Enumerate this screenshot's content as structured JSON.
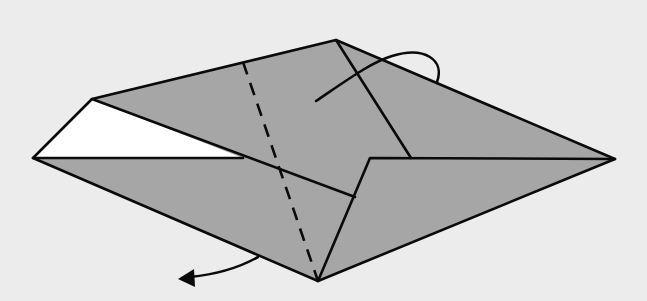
{
  "diagram": {
    "type": "origami-fold-step",
    "colors": {
      "background": "#ececec",
      "paper_colored": "#a6a6a6",
      "paper_white": "#ffffff",
      "line": "#0a0a0a"
    },
    "shapes": {
      "outer_colored": "33,158 92,99 336,40 615,159 318,281",
      "white_flap": "33,158 92,99 243,158",
      "front_flap": "370,158 615,159 318,281"
    },
    "lines": {
      "white_flap_base": "33,158 243,158",
      "diagonal_crease": "92,99 355,197",
      "top_crease": "336,40 411,158",
      "front_flap_edge": "318,281 370,158 615,159",
      "outline": "33,158 92,99 336,40 615,159 318,281 33,158"
    },
    "valley_fold_line": {
      "x1": 243,
      "y1": 62,
      "x2": 318,
      "y2": 281
    },
    "arrows": {
      "top_turn_arrow": "M316,101 C350,78 372,62 392,56 C425,46 445,60 437,82",
      "bottom_fold_arrow": "M258,257 C235,270 210,275 190,277",
      "bottom_arrowhead": "178,279 194,269 195,287"
    }
  }
}
